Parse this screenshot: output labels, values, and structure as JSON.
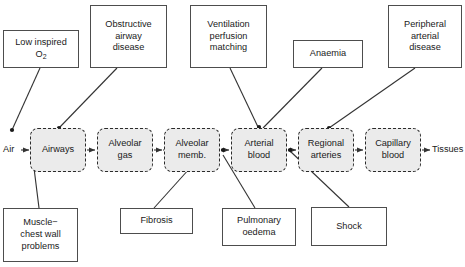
{
  "diagram": {
    "colors": {
      "stage_fill": "#ebebeb",
      "stage_stroke": "#2b2b2b",
      "cause_stroke": "#4d4d4d",
      "line": "#333333",
      "text": "#1a1a1a"
    },
    "stages": [
      {
        "id": "airways",
        "label_line1": "Airways",
        "label_line2": "",
        "x": 30,
        "y": 128,
        "w": 56,
        "h": 44
      },
      {
        "id": "alveolar-gas",
        "label_line1": "Alveolar",
        "label_line2": "gas",
        "x": 97,
        "y": 128,
        "w": 56,
        "h": 44
      },
      {
        "id": "alveolar-memb",
        "label_line1": "Alveolar",
        "label_line2": "memb.",
        "x": 164,
        "y": 128,
        "w": 56,
        "h": 44
      },
      {
        "id": "arterial-blood",
        "label_line1": "Arterial",
        "label_line2": "blood",
        "x": 231,
        "y": 128,
        "w": 56,
        "h": 44
      },
      {
        "id": "regional-arteries",
        "label_line1": "Regional",
        "label_line2": "arteries",
        "x": 298,
        "y": 128,
        "w": 56,
        "h": 44
      },
      {
        "id": "capillary-blood",
        "label_line1": "Capillary",
        "label_line2": "blood",
        "x": 365,
        "y": 128,
        "w": 56,
        "h": 44
      }
    ],
    "endpoints": [
      {
        "id": "air",
        "label": "Air",
        "x": 3,
        "y": 144
      },
      {
        "id": "tissues",
        "label": "Tissues",
        "x": 432,
        "y": 144
      }
    ],
    "causes_top": [
      {
        "id": "low-inspired-o2",
        "line1": "Low inspired",
        "line2": "O",
        "sub": "2",
        "line3": "",
        "x": 3,
        "y": 30,
        "w": 76,
        "h": 38
      },
      {
        "id": "obstructive-airway-disease",
        "line1": "Obstructive",
        "line2": "airway",
        "line3": "disease",
        "x": 90,
        "y": 5,
        "w": 77,
        "h": 63
      },
      {
        "id": "ventilation-perfusion-matching",
        "line1": "Ventilation",
        "line2": "perfusion",
        "line3": "matching",
        "x": 190,
        "y": 5,
        "w": 77,
        "h": 63
      },
      {
        "id": "anaemia",
        "line1": "Anaemia",
        "line2": "",
        "line3": "",
        "x": 293,
        "y": 40,
        "w": 70,
        "h": 28
      },
      {
        "id": "peripheral-arterial-disease",
        "line1": "Peripheral",
        "line2": "arterial",
        "line3": "disease",
        "x": 388,
        "y": 5,
        "w": 74,
        "h": 63
      }
    ],
    "causes_bottom": [
      {
        "id": "muscle-chest-wall-problems",
        "line1": "Muscle−",
        "line2": "chest wall",
        "line3": "problems",
        "x": 3,
        "y": 208,
        "w": 75,
        "h": 54
      },
      {
        "id": "fibrosis",
        "line1": "Fibrosis",
        "line2": "",
        "line3": "",
        "x": 120,
        "y": 208,
        "w": 73,
        "h": 26
      },
      {
        "id": "pulmonary-oedema",
        "line1": "Pulmonary",
        "line2": "oedema",
        "line3": "",
        "x": 222,
        "y": 208,
        "w": 74,
        "h": 38
      },
      {
        "id": "shock",
        "line1": "Shock",
        "line2": "",
        "line3": "",
        "x": 311,
        "y": 207,
        "w": 76,
        "h": 39
      }
    ],
    "flow_arrows": [
      {
        "id": "air-to-airways",
        "from": "air",
        "to": "airways"
      },
      {
        "id": "airways-to-alveolar-gas",
        "from": "airways",
        "to": "alveolar-gas"
      },
      {
        "id": "alveolar-gas-to-alveolar-memb",
        "from": "alveolar-gas",
        "to": "alveolar-memb"
      },
      {
        "id": "alveolar-memb-to-arterial-blood",
        "from": "alveolar-memb",
        "to": "arterial-blood"
      },
      {
        "id": "arterial-blood-to-regional-arteries",
        "from": "arterial-blood",
        "to": "regional-arteries"
      },
      {
        "id": "regional-arteries-to-capillary-blood",
        "from": "regional-arteries",
        "to": "capillary-blood"
      },
      {
        "id": "capillary-blood-to-tissues",
        "from": "capillary-blood",
        "to": "tissues"
      }
    ],
    "cause_links": [
      {
        "id": "link-low-inspired-o2-to-air",
        "from": "low-inspired-o2",
        "to": "air"
      },
      {
        "id": "link-obstructive-airway-disease-to-airways",
        "from": "obstructive-airway-disease",
        "to": "airways"
      },
      {
        "id": "link-ventilation-perfusion-matching-to-arterial-blood",
        "from": "ventilation-perfusion-matching",
        "to": "arterial-blood"
      },
      {
        "id": "link-anaemia-to-arterial-blood",
        "from": "anaemia",
        "to": "arterial-blood"
      },
      {
        "id": "link-peripheral-arterial-disease-to-regional-arteries",
        "from": "peripheral-arterial-disease",
        "to": "regional-arteries"
      },
      {
        "id": "link-muscle-chest-wall-problems-to-airways",
        "from": "muscle-chest-wall-problems",
        "to": "airways"
      },
      {
        "id": "link-fibrosis-to-alveolar-memb",
        "from": "fibrosis",
        "to": "alveolar-memb"
      },
      {
        "id": "link-pulmonary-oedema-to-alveolar-memb",
        "from": "pulmonary-oedema",
        "to": "alveolar-memb"
      },
      {
        "id": "link-shock-to-arterial-blood",
        "from": "shock",
        "to": "arterial-blood"
      }
    ]
  }
}
